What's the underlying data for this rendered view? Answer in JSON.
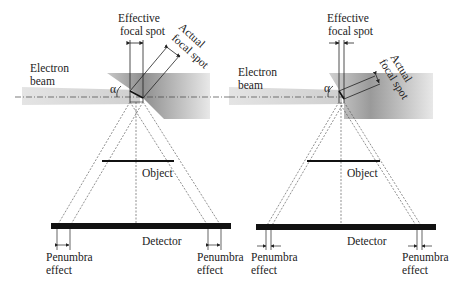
{
  "figure": {
    "panels": [
      {
        "id": "left",
        "labels": {
          "effective_focal_spot_1": "Effective",
          "effective_focal_spot_2": "focal spot",
          "actual_focal_spot_1": "Actual",
          "actual_focal_spot_2": "focal spot",
          "electron_beam_1": "Electron",
          "electron_beam_2": "beam",
          "angle": "α",
          "object": "Object",
          "detector": "Detector",
          "penumbra_left_1": "Penumbra",
          "penumbra_left_2": "effect",
          "penumbra_right_1": "Penumbra",
          "penumbra_right_2": "effect"
        }
      },
      {
        "id": "right",
        "labels": {
          "effective_focal_spot_1": "Effective",
          "effective_focal_spot_2": "focal spot",
          "actual_focal_spot_1": "Actual",
          "actual_focal_spot_2": "focal spot",
          "electron_beam_1": "Electron",
          "electron_beam_2": "beam",
          "angle": "α",
          "object": "Object",
          "detector": "Detector",
          "penumbra_left_1": "Penumbra",
          "penumbra_left_2": "effect",
          "penumbra_right_1": "Penumbra",
          "penumbra_right_2": "effect"
        }
      }
    ],
    "colors": {
      "line": "#222222",
      "anode_dark": "#9a9a9a",
      "anode_light": "#e6e6e6",
      "beam": "#d8d8d8",
      "detector": "#111111"
    }
  }
}
